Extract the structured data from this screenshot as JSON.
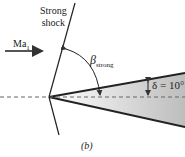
{
  "diagram": {
    "shock_label_line1": "Strong",
    "shock_label_line2": "shock",
    "mach_label": "Ma",
    "mach_sub": "1",
    "beta_symbol": "β",
    "beta_sub": "strong",
    "delta_label": "δ = 10°",
    "caption": "(b)",
    "colors": {
      "line": "#222222",
      "wedge_light": "#ffffff",
      "wedge_dark": "#bdbdbd",
      "arrow": "#555555"
    }
  }
}
